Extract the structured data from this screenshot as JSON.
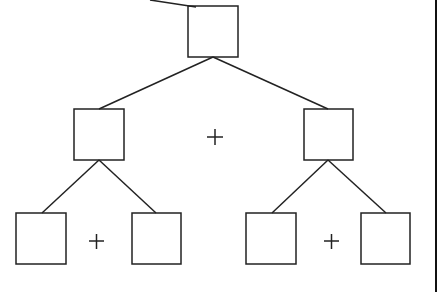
{
  "diagram": {
    "type": "binary-tree",
    "colors": {
      "stroke": "#222222",
      "background": "#ffffff"
    },
    "nodes": [
      {
        "id": "root",
        "x": 188,
        "y": 6,
        "w": 50,
        "h": 51
      },
      {
        "id": "left",
        "x": 74,
        "y": 109,
        "w": 50,
        "h": 51
      },
      {
        "id": "right",
        "x": 304,
        "y": 109,
        "w": 49,
        "h": 51
      },
      {
        "id": "left-left",
        "x": 16,
        "y": 213,
        "w": 50,
        "h": 51
      },
      {
        "id": "left-right",
        "x": 132,
        "y": 213,
        "w": 49,
        "h": 51
      },
      {
        "id": "right-left",
        "x": 246,
        "y": 213,
        "w": 50,
        "h": 51
      },
      {
        "id": "right-right",
        "x": 361,
        "y": 213,
        "w": 49,
        "h": 51
      }
    ],
    "operators": [
      {
        "symbol": "+",
        "x": 215,
        "y": 137
      },
      {
        "symbol": "+",
        "x": 96,
        "y": 241
      },
      {
        "symbol": "+",
        "x": 331,
        "y": 241
      }
    ]
  }
}
